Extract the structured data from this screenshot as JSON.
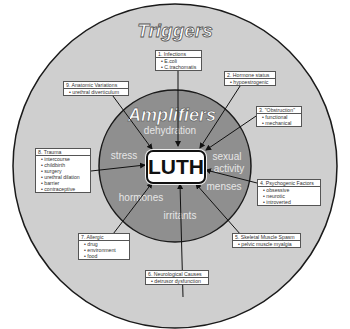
{
  "colors": {
    "outer_ring": "#cfcfcf",
    "inner_ring": "#8f8f8f",
    "outline": "#1a1a1a",
    "center_box": "#ffffff",
    "title_fill": "#ffffff"
  },
  "outer": {
    "title": "Triggers"
  },
  "inner": {
    "title": "Amplifiers",
    "words": [
      "dehydration",
      "stress",
      "sexual",
      "activity",
      "menses",
      "irritants",
      "hormones"
    ]
  },
  "center": {
    "label": "LUTH"
  },
  "triggers": [
    {
      "header": "1. Infections",
      "items": [
        "E.coli",
        "C.trachomatis"
      ]
    },
    {
      "header": "2. Hormone status",
      "items": [
        "hypoestrogenic"
      ]
    },
    {
      "header": "3. \"Obstruction\"",
      "items": [
        "functional",
        "mechanical"
      ]
    },
    {
      "header": "4. Psychogenic Factors",
      "items": [
        "obsessive",
        "neurotic",
        "introverted"
      ]
    },
    {
      "header": "5. Skeletal Muscle Spasm",
      "items": [
        "pelvic muscle myalgia"
      ]
    },
    {
      "header": "6. Neurological Causes",
      "items": [
        "detrusor dysfunction"
      ]
    },
    {
      "header": "7. Allergic",
      "items": [
        "drug",
        "environment",
        "food"
      ]
    },
    {
      "header": "8. Trauma",
      "items": [
        "intercourse",
        "childbirth",
        "surgery",
        "urethral dilation",
        "barrier",
        "contraceptive"
      ]
    },
    {
      "header": "9. Anatomic Variations",
      "items": [
        "urethral diverticulum"
      ]
    }
  ]
}
